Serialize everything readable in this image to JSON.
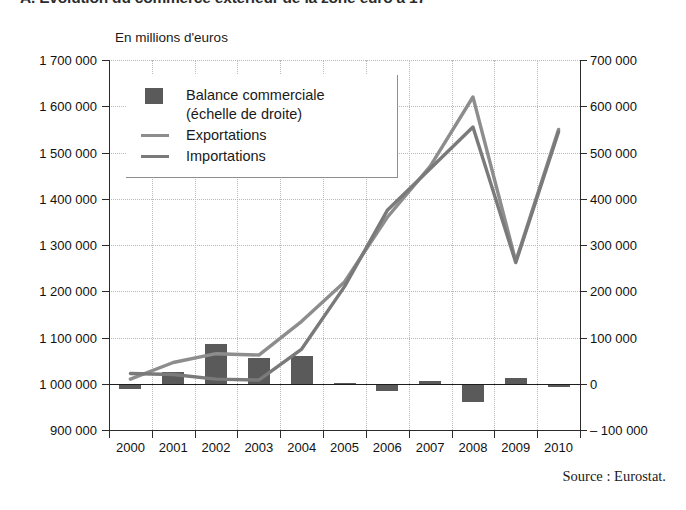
{
  "title": "A. Évolution du commerce extérieur de la zone euro à 17",
  "unit_label": "En millions d'euros",
  "source": "Source : Eurostat.",
  "legend": {
    "items": [
      {
        "key": "bar",
        "label": "Balance commerciale\n(échelle de droite)",
        "color": "#5a5a5a"
      },
      {
        "key": "line",
        "label": "Exportations",
        "color": "#8d8d8d"
      },
      {
        "key": "line",
        "label": "Importations",
        "color": "#7a7a7a"
      }
    ]
  },
  "axes": {
    "left": {
      "unit": "En millions d'euros",
      "ticks": [
        "1 700 000",
        "1 600 000",
        "1 500 000",
        "1 400 000",
        "1 300 000",
        "1 200 000",
        "1 100 000",
        "1 000 000",
        "900 000"
      ],
      "min": 900000,
      "max": 1700000,
      "step": 100000
    },
    "right": {
      "ticks": [
        "700 000",
        "600 000",
        "500 000",
        "400 000",
        "300 000",
        "200 000",
        "100 000",
        "0",
        "– 100 000"
      ],
      "min": -100000,
      "max": 700000,
      "step": 100000
    },
    "x": {
      "ticks": [
        "2000",
        "2001",
        "2002",
        "2003",
        "2004",
        "2005",
        "2006",
        "2007",
        "2008",
        "2009",
        "2010"
      ]
    }
  },
  "chart_data": {
    "type": "bar",
    "title": "A. Évolution du commerce extérieur de la zone euro à 17",
    "subtitle": "En millions d'euros",
    "xlabel": "",
    "ylabel": "En millions d'euros",
    "y2label": "Balance commerciale (échelle de droite)",
    "categories": [
      "2000",
      "2001",
      "2002",
      "2003",
      "2004",
      "2005",
      "2006",
      "2007",
      "2008",
      "2009",
      "2010"
    ],
    "ylim": [
      900000,
      1700000
    ],
    "y2lim": [
      -100000,
      700000
    ],
    "grid": true,
    "legend_position": "top-left",
    "series": [
      {
        "name": "Balance commerciale",
        "type": "bar",
        "axis": "right",
        "color": "#5a5a5a",
        "values": [
          -12000,
          25000,
          85000,
          55000,
          60000,
          2000,
          -15000,
          6000,
          -40000,
          12000,
          -8000
        ]
      },
      {
        "name": "Exportations",
        "type": "line",
        "axis": "left",
        "color": "#8d8d8d",
        "values": [
          1010000,
          1046000,
          1065000,
          1062000,
          1135000,
          1220000,
          1360000,
          1470000,
          1620000,
          1265000,
          1550000
        ]
      },
      {
        "name": "Importations",
        "type": "line",
        "axis": "left",
        "color": "#7a7a7a",
        "values": [
          1022000,
          1020000,
          1010000,
          1008000,
          1075000,
          1210000,
          1375000,
          1465000,
          1555000,
          1262000,
          1545000
        ]
      }
    ]
  }
}
